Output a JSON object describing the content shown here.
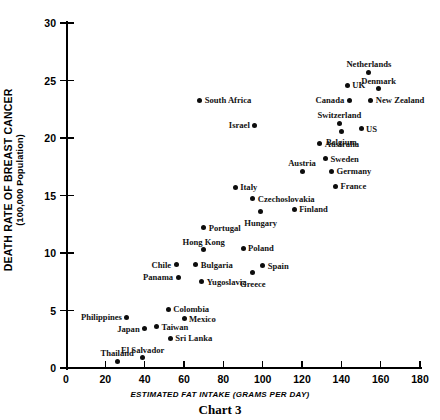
{
  "chart_data": {
    "type": "scatter",
    "title": "Chart 3",
    "xlabel": "ESTIMATED FAT INTAKE (GRAMS PER DAY)",
    "ylabel": "DEATH RATE OF BREAST CANCER",
    "ylabel_sub": "(100,000 Population)",
    "xlim": [
      0,
      180
    ],
    "ylim": [
      0,
      30
    ],
    "xticks": [
      0,
      20,
      40,
      60,
      80,
      100,
      120,
      140,
      160,
      180
    ],
    "yticks": [
      0,
      5,
      10,
      15,
      20,
      25,
      30
    ],
    "grid": false,
    "legend": "none",
    "points": [
      {
        "label": "Netherlands",
        "x": 154,
        "y": 25.7,
        "pos": "above"
      },
      {
        "label": "Denmark",
        "x": 159,
        "y": 24.3,
        "pos": "above"
      },
      {
        "label": "UK",
        "x": 143,
        "y": 24.6,
        "pos": "right"
      },
      {
        "label": "New Zealand",
        "x": 155,
        "y": 23.3,
        "pos": "right"
      },
      {
        "label": "Canada",
        "x": 144,
        "y": 23.3,
        "pos": "left"
      },
      {
        "label": "South Africa",
        "x": 68,
        "y": 23.3,
        "pos": "right"
      },
      {
        "label": "Switzerland",
        "x": 139,
        "y": 21.3,
        "pos": "above"
      },
      {
        "label": "US",
        "x": 150,
        "y": 20.8,
        "pos": "right"
      },
      {
        "label": "Belgium",
        "x": 140,
        "y": 20.6,
        "pos": "below"
      },
      {
        "label": "Israel",
        "x": 96,
        "y": 21.1,
        "pos": "left"
      },
      {
        "label": "Australia",
        "x": 129,
        "y": 19.5,
        "pos": "right"
      },
      {
        "label": "Sweden",
        "x": 132,
        "y": 18.2,
        "pos": "right"
      },
      {
        "label": "Germany",
        "x": 135,
        "y": 17.1,
        "pos": "right"
      },
      {
        "label": "Austria",
        "x": 120,
        "y": 17.1,
        "pos": "above"
      },
      {
        "label": "France",
        "x": 137,
        "y": 15.8,
        "pos": "right"
      },
      {
        "label": "Italy",
        "x": 86,
        "y": 15.7,
        "pos": "right"
      },
      {
        "label": "Czechoslovakia",
        "x": 95,
        "y": 14.7,
        "pos": "right"
      },
      {
        "label": "Finland",
        "x": 116,
        "y": 13.8,
        "pos": "right"
      },
      {
        "label": "Hungary",
        "x": 99,
        "y": 13.6,
        "pos": "below"
      },
      {
        "label": "Portugal",
        "x": 70,
        "y": 12.2,
        "pos": "right"
      },
      {
        "label": "Poland",
        "x": 90,
        "y": 10.4,
        "pos": "right"
      },
      {
        "label": "Hong Kong",
        "x": 70,
        "y": 10.3,
        "pos": "above"
      },
      {
        "label": "Spain",
        "x": 100,
        "y": 8.9,
        "pos": "right"
      },
      {
        "label": "Bulgaria",
        "x": 66,
        "y": 9.0,
        "pos": "right"
      },
      {
        "label": "Chile",
        "x": 56,
        "y": 9.0,
        "pos": "left"
      },
      {
        "label": "Greece",
        "x": 95,
        "y": 8.3,
        "pos": "below"
      },
      {
        "label": "Panama",
        "x": 57,
        "y": 7.9,
        "pos": "left"
      },
      {
        "label": "Yugoslavia",
        "x": 69,
        "y": 7.5,
        "pos": "right"
      },
      {
        "label": "Colombia",
        "x": 52,
        "y": 5.1,
        "pos": "right"
      },
      {
        "label": "Mexico",
        "x": 60,
        "y": 4.3,
        "pos": "right"
      },
      {
        "label": "Philippines",
        "x": 31,
        "y": 4.4,
        "pos": "left"
      },
      {
        "label": "Taiwan",
        "x": 46,
        "y": 3.6,
        "pos": "right"
      },
      {
        "label": "Japan",
        "x": 40,
        "y": 3.4,
        "pos": "left"
      },
      {
        "label": "Sri Lanka",
        "x": 53,
        "y": 2.6,
        "pos": "right"
      },
      {
        "label": "El Salvador",
        "x": 39,
        "y": 0.9,
        "pos": "above"
      },
      {
        "label": "Thailand",
        "x": 26,
        "y": 0.6,
        "pos": "above"
      }
    ]
  }
}
